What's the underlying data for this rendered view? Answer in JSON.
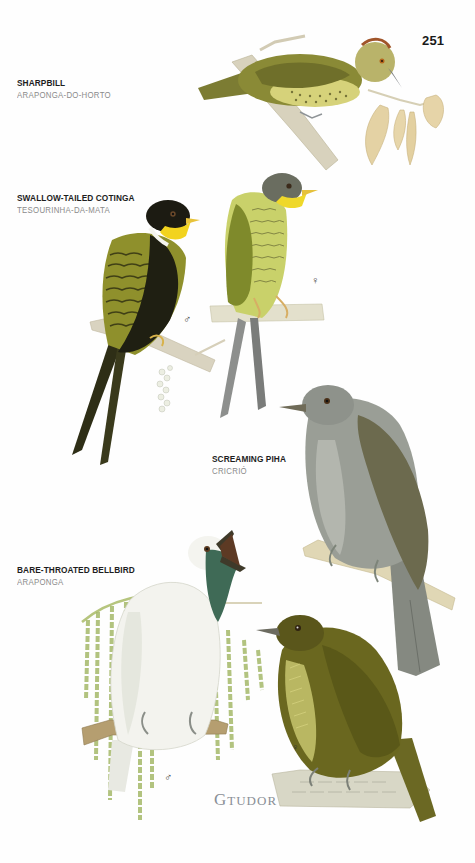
{
  "page": {
    "number": "251",
    "signature": "GTUDOR",
    "signature_parts": {
      "initial": "G",
      "surname": "TUDOR"
    }
  },
  "species": [
    {
      "english_name": "SHARPBILL",
      "portuguese_name": "ARAPONGA-DO-HORTO",
      "illustrations": [
        {
          "sex": "",
          "plumage_colors": [
            "#7d7f2e",
            "#c9c56a",
            "#a0522d"
          ]
        }
      ]
    },
    {
      "english_name": "SWALLOW-TAILED COTINGA",
      "portuguese_name": "TESOURINHA-DA-MATA",
      "illustrations": [
        {
          "sex": "♂",
          "plumage_colors": [
            "#1e1d12",
            "#f1d21f",
            "#8d8f2c"
          ]
        },
        {
          "sex": "♀",
          "plumage_colors": [
            "#5f6250",
            "#e6d42b",
            "#94a03a"
          ]
        }
      ]
    },
    {
      "english_name": "SCREAMING PIHA",
      "portuguese_name": "CRICRIÓ",
      "illustrations": [
        {
          "sex": "",
          "plumage_colors": [
            "#8c9187",
            "#6b6a4c",
            "#b9bab2"
          ]
        }
      ]
    },
    {
      "english_name": "BARE-THROATED BELLBIRD",
      "portuguese_name": "ARAPONGA",
      "illustrations": [
        {
          "sex": "♂",
          "plumage_colors": [
            "#f4f4ef",
            "#3e6a55",
            "#4a3a2a"
          ]
        },
        {
          "sex": "♀",
          "plumage_colors": [
            "#5e5a1d",
            "#d9d88a",
            "#767328"
          ]
        }
      ]
    }
  ],
  "colors": {
    "heading_text": "#1d1d1d",
    "subheading_text": "#8a8a8a",
    "branch": "#d7d1b8",
    "leaves_dry": "#e2cf9f",
    "palm_green": "#b4c47a"
  }
}
